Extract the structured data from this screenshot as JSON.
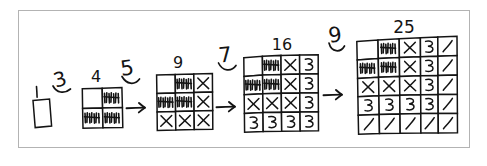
{
  "figure": {
    "title": "Square numbers built by adding odd gnomons",
    "border_color": "#b3b3b3",
    "ink_color": "#141414",
    "background": "#ffffff"
  },
  "steps": [
    {
      "id": "step-1",
      "size_label": "1",
      "grid_rows": 1,
      "grid_cols": 1,
      "cells": [
        [
          "blank"
        ]
      ]
    },
    {
      "id": "step-4",
      "size_label": "4",
      "grid_rows": 2,
      "grid_cols": 2,
      "cells": [
        [
          "blank",
          "tally"
        ],
        [
          "tally",
          "tally"
        ]
      ]
    },
    {
      "id": "step-9",
      "size_label": "9",
      "grid_rows": 3,
      "grid_cols": 3,
      "cells": [
        [
          "blank",
          "tally",
          "x"
        ],
        [
          "tally",
          "tally",
          "x"
        ],
        [
          "x",
          "x",
          "x"
        ]
      ]
    },
    {
      "id": "step-16",
      "size_label": "16",
      "grid_rows": 4,
      "grid_cols": 4,
      "cells": [
        [
          "blank",
          "tally",
          "x",
          "three"
        ],
        [
          "tally",
          "tally",
          "x",
          "three"
        ],
        [
          "x",
          "x",
          "x",
          "three"
        ],
        [
          "three",
          "three",
          "three",
          "three"
        ]
      ]
    },
    {
      "id": "step-25",
      "size_label": "25",
      "grid_rows": 5,
      "grid_cols": 5,
      "cells": [
        [
          "blank",
          "tally",
          "x",
          "three",
          "slash"
        ],
        [
          "tally",
          "tally",
          "x",
          "three",
          "slash"
        ],
        [
          "x",
          "x",
          "x",
          "three",
          "slash"
        ],
        [
          "three",
          "three",
          "three",
          "three",
          "slash"
        ],
        [
          "slash",
          "slash",
          "slash",
          "slash",
          "slash"
        ]
      ]
    }
  ],
  "gnomon_labels": [
    {
      "id": "gnomon-3",
      "text": "3"
    },
    {
      "id": "gnomon-5",
      "text": "5"
    },
    {
      "id": "gnomon-7",
      "text": "7"
    },
    {
      "id": "gnomon-9",
      "text": "9"
    }
  ],
  "arrows": [
    {
      "id": "arrow-1"
    },
    {
      "id": "arrow-2"
    },
    {
      "id": "arrow-3"
    },
    {
      "id": "arrow-4"
    }
  ],
  "glyph_legend": {
    "blank": "empty cell",
    "tally": "dense vertical tally scribble",
    "x": "X mark",
    "three": "digit 3",
    "slash": "forward slash"
  }
}
